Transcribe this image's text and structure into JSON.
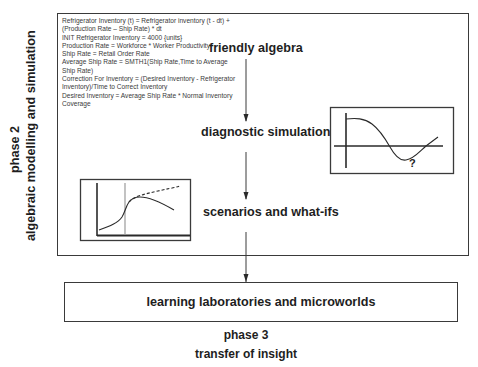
{
  "phase2": {
    "label": "phase 2",
    "subtitle": "algebraic modelling and simulation"
  },
  "equations": [
    "Refrigerator Inventory (t) = Refrigerator inventory (t - dt) +",
    "(Production Rate – Ship Rate) * dt",
    "INIT Refrigerator Inventory =  4000     {units}",
    "Production Rate = Workforce * Worker Productivity",
    "Ship Rate =  Retail Order Rate",
    "Average Ship Rate =  SMTH1(Ship Rate,Time to Average",
    "Ship Rate)",
    "Correction For Inventory =  (Desired Inventory - Refrigerator",
    "Inventory)/Time to Correct Inventory",
    "Desired Inventory = Average Ship Rate * Normal Inventory",
    "Coverage"
  ],
  "stages": {
    "friendly_algebra": "friendly  algebra",
    "diagnostic_simulations": "diagnostic simulations",
    "scenarios": "scenarios and what-ifs"
  },
  "diagnostic_chart": {
    "annotation": "?"
  },
  "phase3": {
    "box_label": "learning laboratories and microworlds",
    "label": "phase 3",
    "subtitle": "transfer of insight"
  },
  "colors": {
    "line": "#2a2a2a",
    "frame": "#3a3a3a",
    "marker_line": "#9a9a9a"
  }
}
